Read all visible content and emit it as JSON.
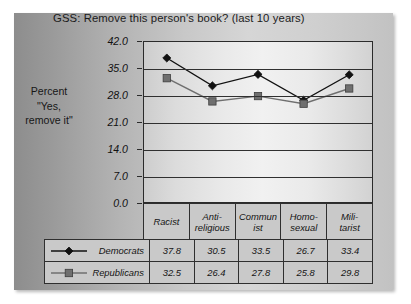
{
  "chart_data": {
    "type": "line",
    "title": "GSS:  Remove this person's book? (last 10 years)",
    "ylabel_lines": [
      "Percent",
      "\"Yes,",
      "remove it\""
    ],
    "xlabel": "",
    "categories": [
      "Racist",
      "Anti-religious",
      "Communist",
      "Homosexual",
      "Militarist"
    ],
    "category_label_lines": [
      [
        "Racist"
      ],
      [
        "Anti-",
        "religious"
      ],
      [
        "Commun",
        "ist"
      ],
      [
        "Homo-",
        "sexual"
      ],
      [
        "Mili-",
        "tarist"
      ]
    ],
    "series": [
      {
        "name": "Democrats",
        "values": [
          37.8,
          30.5,
          33.5,
          26.7,
          33.4
        ],
        "marker": "diamond",
        "color": "#111111"
      },
      {
        "name": "Republicans",
        "values": [
          32.5,
          26.4,
          27.8,
          25.8,
          29.8
        ],
        "marker": "square",
        "color": "#6f6f6f"
      }
    ],
    "ylim": [
      0.0,
      42.0
    ],
    "ytick_values": [
      42.0,
      35.0,
      28.0,
      21.0,
      14.0,
      7.0,
      0.0
    ],
    "ytick_labels": [
      "42.0",
      "35.0",
      "28.0",
      "21.0",
      "14.0",
      "7.0",
      "0.0"
    ],
    "grid": true,
    "grid_axis": "y",
    "legend_position": "bottom-table",
    "table_rows": [
      {
        "label": "Democrats",
        "values": [
          "37.8",
          "30.5",
          "33.5",
          "26.7",
          "33.4"
        ]
      },
      {
        "label": "Republicans",
        "values": [
          "32.5",
          "26.4",
          "27.8",
          "25.8",
          "29.8"
        ]
      }
    ]
  }
}
